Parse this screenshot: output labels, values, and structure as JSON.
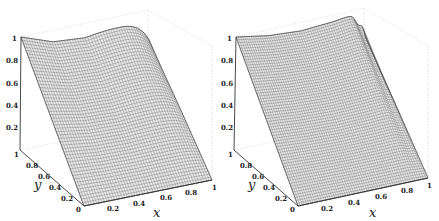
{
  "chart_data": [
    {
      "type": "surface3d",
      "title": "",
      "panel": "left",
      "xlabel": "x",
      "ylabel": "y",
      "zlabel": "",
      "xlim": [
        0,
        1
      ],
      "ylim": [
        0,
        1
      ],
      "zlim": [
        0,
        1
      ],
      "x_ticks": [
        "0.2",
        "0.4",
        "0.6",
        "0.8",
        "1"
      ],
      "y_ticks": [
        "0",
        "0.2",
        "0.4",
        "0.6",
        "0.8",
        "1"
      ],
      "z_ticks": [
        "0.2",
        "0.4",
        "0.6",
        "0.8",
        "1"
      ],
      "grid": false,
      "box": true,
      "mesh_lines": 50,
      "description": "Surface z(x,y) ~ y-weighted convex profile: z=0 along y=0 rising linearly in y; at y=1 curve dips from 1 at x=0 to ~0.85 mid then back up to ~1 at x=1; at x=1 edge height ~0.7*y... corner (1,0) ~0",
      "corner_values": {
        "x0_y0": 0,
        "x1_y0": 0,
        "x0_y1": 1,
        "x1_y1": 1,
        "x1_y1_edge_right": 0.75
      },
      "edge_y1": {
        "x": [
          0,
          0.25,
          0.5,
          0.75,
          1
        ],
        "z": [
          1,
          0.9,
          0.88,
          0.93,
          1
        ]
      },
      "edge_x1": {
        "y": [
          0,
          0.25,
          0.5,
          0.75,
          1
        ],
        "z": [
          0,
          0.19,
          0.38,
          0.56,
          0.75
        ]
      }
    },
    {
      "type": "surface3d",
      "title": "",
      "panel": "right",
      "xlabel": "x",
      "ylabel": "y",
      "zlabel": "",
      "xlim": [
        0,
        1
      ],
      "ylim": [
        0,
        1
      ],
      "zlim": [
        0,
        1
      ],
      "x_ticks": [
        "0.2",
        "0.4",
        "0.6",
        "0.8",
        "1"
      ],
      "y_ticks": [
        "0",
        "0.2",
        "0.4",
        "0.6",
        "0.8",
        "1"
      ],
      "z_ticks": [
        "0.2",
        "0.4",
        "0.6",
        "0.8",
        "1"
      ],
      "grid": false,
      "box": true,
      "mesh_lines": 60,
      "description": "Similar surface with sharper boundary-layer near x=1: flat-ish sheet with a thin fold rising steeply at the x=1 edge",
      "corner_values": {
        "x0_y0": 0,
        "x1_y0": 0,
        "x0_y1": 1,
        "x1_y1": 1,
        "x1_y1_edge_right": 0.75
      },
      "edge_y1": {
        "x": [
          0,
          0.25,
          0.5,
          0.75,
          1
        ],
        "z": [
          1,
          0.95,
          0.93,
          0.95,
          1
        ]
      },
      "edge_x1": {
        "y": [
          0,
          0.25,
          0.5,
          0.75,
          1
        ],
        "z": [
          0,
          0.19,
          0.38,
          0.56,
          0.75
        ]
      }
    }
  ],
  "labels": {
    "x_axis": "x",
    "y_axis": "y",
    "x_ticks": [
      "0.2",
      "0.4",
      "0.6",
      "0.8",
      "1"
    ],
    "y_ticks": [
      "0",
      "0.2",
      "0.4",
      "0.6",
      "0.8",
      "1"
    ],
    "z_ticks": [
      "0.2",
      "0.4",
      "0.6",
      "0.8",
      "1"
    ]
  },
  "colors": {
    "mesh": "#5a5a5a",
    "surface_fill": "#e8e8e8",
    "box": "#c8c8c8",
    "axis": "#333333"
  }
}
